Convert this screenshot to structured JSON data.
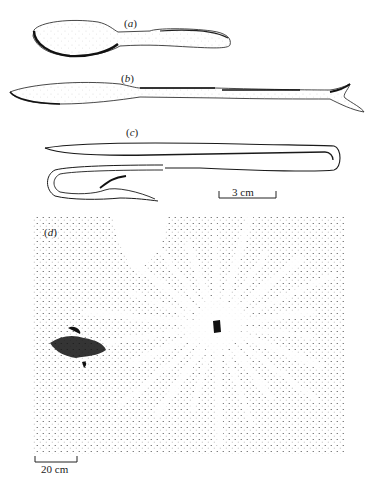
{
  "figure": {
    "panels": [
      {
        "id": "a",
        "label_open": "(",
        "label_letter": "a",
        "label_close": ")",
        "subject": "spoon-shaped implement"
      },
      {
        "id": "b",
        "label_open": "(",
        "label_letter": "b",
        "label_close": ")",
        "subject": "blade-shaped implement with forked end"
      },
      {
        "id": "c",
        "label_open": "(",
        "label_letter": "c",
        "label_close": ")",
        "subject": "bent hairpin-shaped implement"
      },
      {
        "id": "d",
        "label_open": "(",
        "label_letter": "d",
        "label_close": ")",
        "subject": "stippled ground plan with radiating pattern"
      }
    ],
    "scale_bars": {
      "artifacts": {
        "text": "3 cm",
        "length_cm": 3
      },
      "plan": {
        "text": "20 cm",
        "length_cm": 20
      }
    },
    "colors": {
      "ink": "#1a1a1a",
      "paper": "#ffffff"
    }
  }
}
